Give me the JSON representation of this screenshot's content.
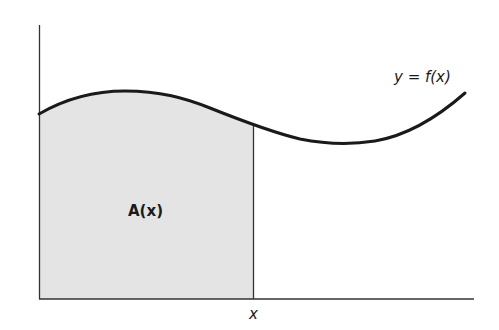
{
  "diagram": {
    "curve_label": "y = f(x)",
    "area_label": "A(x)",
    "x_label": "x",
    "colors": {
      "stroke": "#1a1a1a",
      "fill": "#e6e6e6",
      "background": "#ffffff"
    }
  }
}
